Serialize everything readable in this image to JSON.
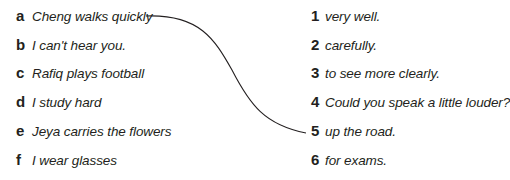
{
  "exercise": {
    "left_items": [
      {
        "label": "a",
        "text": "Cheng walks quickly"
      },
      {
        "label": "b",
        "text": "I can't hear you."
      },
      {
        "label": "c",
        "text": "Rafiq plays football"
      },
      {
        "label": "d",
        "text": "I study hard"
      },
      {
        "label": "e",
        "text": "Jeya carries the flowers"
      },
      {
        "label": "f",
        "text": "I wear glasses"
      }
    ],
    "right_items": [
      {
        "label": "1",
        "text": "very well."
      },
      {
        "label": "2",
        "text": "carefully."
      },
      {
        "label": "3",
        "text": "to see more clearly."
      },
      {
        "label": "4",
        "text": "Could you speak a little louder?"
      },
      {
        "label": "5",
        "text": "up the road."
      },
      {
        "label": "6",
        "text": "for exams."
      }
    ],
    "connections": [
      {
        "from": "a",
        "to": "5"
      }
    ],
    "colors": {
      "text": "#231f20",
      "line": "#231f20",
      "background": "#ffffff"
    }
  }
}
